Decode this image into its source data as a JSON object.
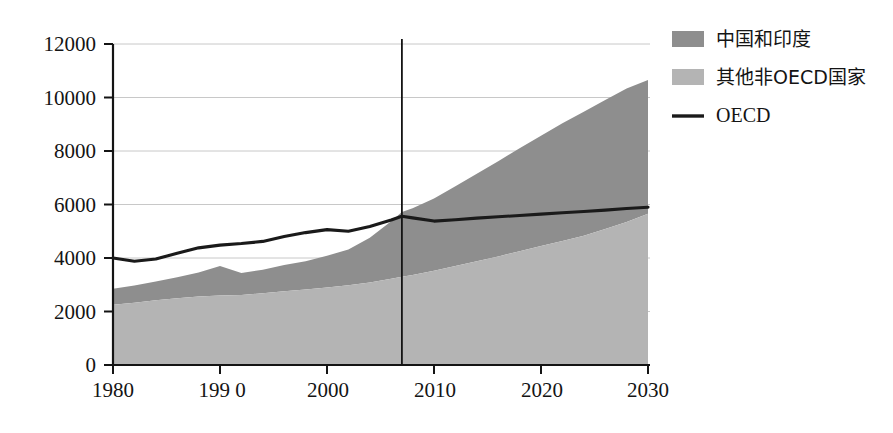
{
  "chart_data": {
    "type": "area",
    "title": "",
    "subtitle": "",
    "xlabel": "",
    "ylabel": "",
    "xlim": [
      1980,
      2030
    ],
    "ylim": [
      0,
      12000
    ],
    "grid": true,
    "legend_position": "right",
    "stacked": true,
    "x": [
      1980,
      1982,
      1984,
      1986,
      1988,
      1990,
      1992,
      1994,
      1996,
      1998,
      2000,
      2002,
      2004,
      2006,
      2007,
      2008,
      2010,
      2012,
      2014,
      2016,
      2018,
      2020,
      2022,
      2024,
      2026,
      2028,
      2030
    ],
    "series": [
      {
        "name": "其他非OECD国家",
        "type": "area-stacked",
        "order": 1,
        "color": "#b4b4b4",
        "values": [
          2250,
          2330,
          2420,
          2500,
          2560,
          2600,
          2620,
          2680,
          2760,
          2820,
          2900,
          2980,
          3080,
          3220,
          3300,
          3360,
          3520,
          3700,
          3880,
          4060,
          4250,
          4450,
          4640,
          4830,
          5080,
          5350,
          5650
        ]
      },
      {
        "name": "中国和印度",
        "type": "area-stacked",
        "order": 2,
        "color": "#8e8e8e",
        "values": [
          600,
          640,
          700,
          780,
          900,
          1100,
          820,
          880,
          980,
          1060,
          1180,
          1340,
          1680,
          2150,
          2420,
          2500,
          2700,
          2980,
          3270,
          3560,
          3850,
          4120,
          4400,
          4640,
          4830,
          4990,
          5000
        ]
      },
      {
        "name": "OECD",
        "type": "line",
        "order": 3,
        "color": "#1a1a1a",
        "values": [
          4000,
          3880,
          3960,
          4180,
          4380,
          4480,
          4540,
          4620,
          4800,
          4950,
          5060,
          5000,
          5180,
          5420,
          5560,
          5500,
          5380,
          5430,
          5490,
          5540,
          5590,
          5640,
          5690,
          5740,
          5790,
          5850,
          5900
        ]
      }
    ],
    "stacked_totals": {
      "note": "sum of 其他非OECD国家 + 中国和印度",
      "values": [
        2850,
        2970,
        3120,
        3280,
        3460,
        3700,
        3440,
        3560,
        3740,
        3880,
        4080,
        4320,
        4760,
        5370,
        5720,
        5860,
        6220,
        6680,
        7150,
        7620,
        8100,
        8570,
        9040,
        9470,
        9910,
        10340,
        10650
      ]
    },
    "yticks": [
      0,
      2000,
      4000,
      6000,
      8000,
      10000,
      12000
    ],
    "ytick_labels": [
      "0",
      "2000",
      "4000",
      "6000",
      "8000",
      "10000",
      "12000"
    ],
    "xticks": [
      1980,
      1990,
      2000,
      2010,
      2020,
      2030
    ],
    "xtick_labels": [
      "1980",
      "199 0",
      "2000",
      "2010",
      "2020",
      "2030"
    ],
    "annotations": [
      {
        "name": "projection-divider",
        "type": "vline",
        "x": 2007,
        "label": ""
      }
    ],
    "legend": [
      {
        "label": "中国和印度",
        "marker": "swatch",
        "color": "#8e8e8e"
      },
      {
        "label": "其他非OECD国家",
        "marker": "swatch",
        "color": "#b4b4b4"
      },
      {
        "label": "OECD",
        "marker": "line",
        "color": "#1a1a1a"
      }
    ]
  },
  "colors": {
    "axis": "#141414",
    "grid": "#c8c8c8",
    "china_india": "#8e8e8e",
    "other_non_oecd": "#b4b4b4",
    "oecd_line": "#1a1a1a",
    "divider": "#141414",
    "background": "#ffffff"
  }
}
